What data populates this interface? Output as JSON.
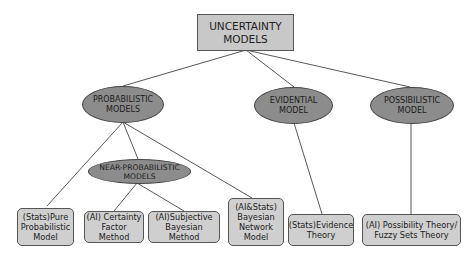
{
  "diagram": {
    "type": "tree",
    "colors": {
      "root_fill": "#c8c8c8",
      "category_fill": "#8c8c8c",
      "leaf_fill": "#cfcfcf",
      "edge": "#444444"
    },
    "root": {
      "label": "UNCERTAINTY\nMODELS"
    },
    "categories": [
      {
        "id": "probabilistic",
        "label": "PROBABILISTIC\nMODELS"
      },
      {
        "id": "evidential",
        "label": "EVIDENTIAL\nMODEL"
      },
      {
        "id": "possibilistic",
        "label": "POSSIBILISTIC\nMODEL"
      },
      {
        "id": "near_probabilistic",
        "label": "NEAR-PROBABILISTIC\nMODELS"
      }
    ],
    "leaves": [
      {
        "id": "pure_prob",
        "label": "(Stats)Pure\nProbabilistic\nModel"
      },
      {
        "id": "certainty_factor",
        "label": "(AI) Certainty\nFactor Method"
      },
      {
        "id": "subjective_bayes",
        "label": "(AI)Subjective\nBayesian Method"
      },
      {
        "id": "bayes_net",
        "label": "(AI&Stats)\nBayesian\nNetwork\nModel"
      },
      {
        "id": "evidence_theory",
        "label": "(Stats)Evidence\nTheory"
      },
      {
        "id": "possibility_theory",
        "label": "(AI) Possibility Theory/\nFuzzy Sets Theory"
      }
    ],
    "edges": [
      [
        "root",
        "probabilistic"
      ],
      [
        "root",
        "evidential"
      ],
      [
        "root",
        "possibilistic"
      ],
      [
        "probabilistic",
        "near_probabilistic"
      ],
      [
        "probabilistic",
        "pure_prob"
      ],
      [
        "probabilistic",
        "bayes_net"
      ],
      [
        "near_probabilistic",
        "certainty_factor"
      ],
      [
        "near_probabilistic",
        "subjective_bayes"
      ],
      [
        "evidential",
        "evidence_theory"
      ],
      [
        "possibilistic",
        "possibility_theory"
      ]
    ]
  }
}
